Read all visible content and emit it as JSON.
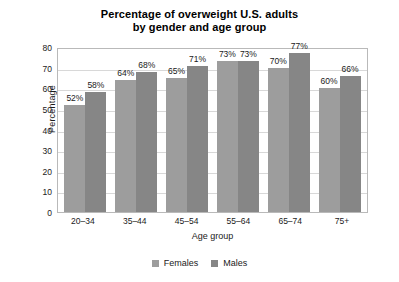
{
  "chart_data": {
    "type": "bar",
    "title": "Percentage of overweight U.S. adults by gender and age group",
    "title_lines": [
      "Percentage of overweight U.S. adults",
      "by gender and age group"
    ],
    "xlabel": "Age group",
    "ylabel": "Percentage",
    "categories": [
      "20–34",
      "35–44",
      "45–54",
      "55–64",
      "65–74",
      "75+"
    ],
    "series": [
      {
        "name": "Females",
        "color": "#9d9d9d",
        "values": [
          52,
          64,
          65,
          73,
          70,
          60
        ],
        "labels": [
          "52%",
          "64%",
          "65%",
          "73%",
          "70%",
          "60%"
        ]
      },
      {
        "name": "Males",
        "color": "#868686",
        "values": [
          58,
          68,
          71,
          73,
          77,
          66
        ],
        "labels": [
          "58%",
          "68%",
          "71%",
          "73%",
          "77%",
          "66%"
        ]
      }
    ],
    "ylim": [
      0,
      80
    ],
    "yticks": [
      80,
      70,
      60,
      50,
      40,
      30,
      20,
      10,
      0
    ],
    "ytick_labels": [
      "80",
      "70",
      "60",
      "50",
      "40",
      "30",
      "20",
      "10",
      "0"
    ],
    "grid": true,
    "legend_position": "bottom"
  }
}
